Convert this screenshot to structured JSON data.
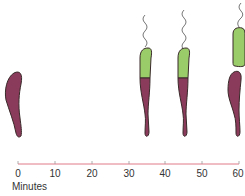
{
  "diagram": {
    "title": "",
    "colors": {
      "stalked_cell": "#8a3a5a",
      "swarmer_cell": "#9acd6a",
      "outline": "#3a2a2a",
      "axis": "#e07a8a",
      "flagellum": "#555555"
    },
    "stages": [
      {
        "minute": 0,
        "description": "stalked cell"
      },
      {
        "minute": 35,
        "description": "predivisional cell with flagellated swarmer pole"
      },
      {
        "minute": 45,
        "description": "predivisional cell with flagellated swarmer pole"
      },
      {
        "minute": 60,
        "description": "separated swarmer cell and stalked cell"
      }
    ]
  },
  "axis": {
    "title": "Minutes",
    "ticks": [
      "0",
      "10",
      "20",
      "30",
      "40",
      "50",
      "60"
    ]
  }
}
